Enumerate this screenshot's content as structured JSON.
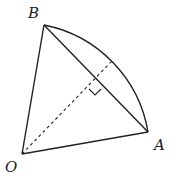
{
  "diagram": {
    "type": "sector-geometry",
    "labels": {
      "B": "B",
      "O": "O",
      "A": "A"
    },
    "points": {
      "O": [
        22,
        154
      ],
      "A": [
        148,
        132
      ],
      "B": [
        44,
        25
      ],
      "M": [
        95,
        84
      ],
      "arc_mid": [
        112,
        61
      ]
    },
    "elements": [
      {
        "kind": "segment",
        "from": "O",
        "to": "A",
        "style": "solid"
      },
      {
        "kind": "segment",
        "from": "O",
        "to": "B",
        "style": "solid"
      },
      {
        "kind": "segment",
        "from": "A",
        "to": "B",
        "style": "solid",
        "role": "chord"
      },
      {
        "kind": "arc",
        "from": "B",
        "to": "A",
        "center": "O",
        "style": "solid"
      },
      {
        "kind": "segment",
        "from": "O",
        "to": "arc_mid",
        "style": "dashed",
        "role": "perpendicular bisector"
      },
      {
        "kind": "right-angle-mark",
        "at": "M"
      }
    ],
    "stroke_color": "#222222"
  }
}
